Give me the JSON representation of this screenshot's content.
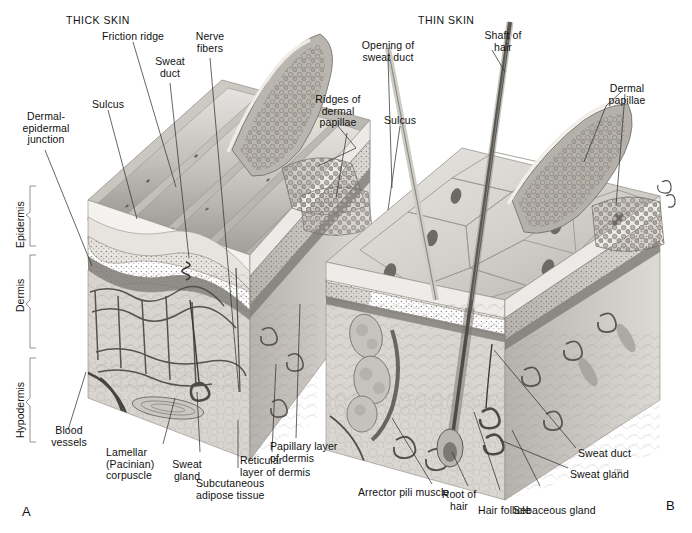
{
  "figure": {
    "kind": "anatomical-illustration",
    "plate_a": "A",
    "plate_b": "B"
  },
  "panels": {
    "left": {
      "title": "THICK SKIN"
    },
    "right": {
      "title": "THIN SKIN"
    }
  },
  "layer_labels": [
    {
      "name": "epidermis",
      "text": "Epidermis"
    },
    {
      "name": "dermis",
      "text": "Dermis"
    },
    {
      "name": "hypodermis",
      "text": "Hypodermis"
    }
  ],
  "labels_thick_skin": [
    {
      "name": "friction-ridge",
      "text": "Friction ridge"
    },
    {
      "name": "nerve-fibers",
      "text": "Nerve\nfibers"
    },
    {
      "name": "sweat-duct",
      "text": "Sweat\nduct"
    },
    {
      "name": "sulcus",
      "text": "Sulcus"
    },
    {
      "name": "dermal-epidermal-junction",
      "text": "Dermal-\nepidermal\njunction"
    },
    {
      "name": "ridges-of-dermal-papillae",
      "text": "Ridges of\ndermal\npapillae"
    },
    {
      "name": "blood-vessels",
      "text": "Blood\nvessels"
    },
    {
      "name": "lamellar-pacinian-corpuscle",
      "text": "Lamellar\n(Pacinian)\ncorpuscle"
    },
    {
      "name": "sweat-gland",
      "text": "Sweat\ngland"
    },
    {
      "name": "subcutaneous-adipose-tissue",
      "text": "Subcutaneous\nadipose tissue"
    },
    {
      "name": "reticular-layer-of-dermis",
      "text": "Reticular\nlayer of dermis"
    },
    {
      "name": "papillary-layer-of-dermis",
      "text": "Papillary layer\nof dermis"
    }
  ],
  "labels_thin_skin": [
    {
      "name": "opening-of-sweat-duct",
      "text": "Opening of\nsweat duct"
    },
    {
      "name": "shaft-of-hair",
      "text": "Shaft of\nhair"
    },
    {
      "name": "dermal-papillae",
      "text": "Dermal\npapillae"
    },
    {
      "name": "sulcus",
      "text": "Sulcus"
    },
    {
      "name": "arrector-pili-muscle",
      "text": "Arrector pili muscle"
    },
    {
      "name": "root-of-hair",
      "text": "Root of\nhair"
    },
    {
      "name": "hair-follicle",
      "text": "Hair follicle"
    },
    {
      "name": "sebaceous-gland",
      "text": "Sebaceous gland"
    },
    {
      "name": "sweat-gland",
      "text": "Sweat gland"
    },
    {
      "name": "sweat-duct",
      "text": "Sweat duct"
    }
  ],
  "palette": {
    "background": "#ffffff",
    "text": "#111111",
    "leader_line": "#333333",
    "bracket": "#777777",
    "epidermis_surface_light": "#e4e2de",
    "epidermis_surface_mid": "#c9c6c1",
    "epidermis_surface_dark": "#a9a6a1",
    "stratum_corneum": "#f2f0ec",
    "stratum_granular": "#8e8a85",
    "dermis_fill": "#d6d3ce",
    "hypodermis_fill": "#dedbd6",
    "papillae_dark": "#6f6b66",
    "papillae_mid": "#9b9792",
    "vessel_dark": "#4a4744",
    "hair_dark": "#55514d"
  }
}
